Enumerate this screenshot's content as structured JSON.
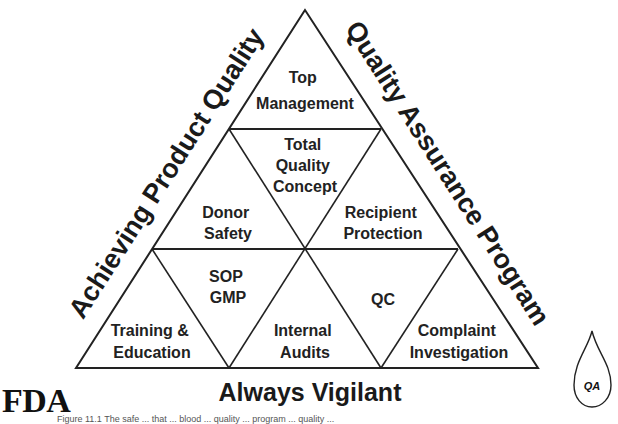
{
  "diagram": {
    "type": "triangle-pyramid",
    "side_labels": {
      "left": "Achieving Product Quality",
      "right": "Quality Assurance Program",
      "bottom": "Always Vigilant"
    },
    "cells": {
      "top": [
        "Top",
        "Management"
      ],
      "center": [
        "Total",
        "Quality",
        "Concept"
      ],
      "middle_left": [
        "Donor",
        "Safety"
      ],
      "middle_right": [
        "Recipient",
        "Protection"
      ],
      "lower_center_left": [
        "SOP",
        "GMP"
      ],
      "lower_center_right": [
        "QC"
      ],
      "bottom_left": [
        "Training &",
        "Education"
      ],
      "bottom_center": [
        "Internal",
        "Audits"
      ],
      "bottom_right": [
        "Complaint",
        "Investigation"
      ]
    },
    "agency": "FDA",
    "drop_icon_label": "QA",
    "caption": "Figure 11.1 The safe ... that ... blood ... quality ... program ... quality ... "
  },
  "colors": {
    "line": "#222222",
    "text": "#1a1a1a",
    "background": "#ffffff"
  }
}
